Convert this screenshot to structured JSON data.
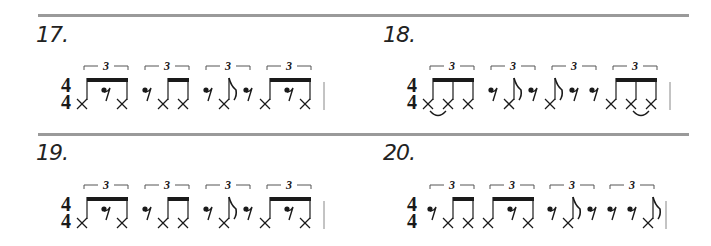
{
  "page": {
    "exercises": [
      {
        "number": "17.",
        "time_signature": {
          "top": "4",
          "bottom": "4"
        },
        "groups": [
          {
            "tuplet": "3",
            "notes": [
              "x-eighth",
              "eighth-rest",
              "x-eighth"
            ]
          },
          {
            "tuplet": "3",
            "notes": [
              "eighth-rest",
              "x-eighth",
              "x-eighth"
            ]
          },
          {
            "tuplet": "3",
            "notes": [
              "eighth-rest",
              "x-eighth-flag",
              "eighth-rest"
            ]
          },
          {
            "tuplet": "3",
            "notes": [
              "x-eighth",
              "eighth-rest",
              "x-eighth"
            ]
          }
        ]
      },
      {
        "number": "18.",
        "time_signature": {
          "top": "4",
          "bottom": "4"
        },
        "groups": [
          {
            "tuplet": "3",
            "notes": [
              "x-eighth",
              "x-eighth",
              "x-eighth"
            ],
            "tie": "1-2"
          },
          {
            "tuplet": "3",
            "notes": [
              "eighth-rest",
              "x-eighth-flag",
              "eighth-rest"
            ]
          },
          {
            "tuplet": "3",
            "notes": [
              "x-eighth-flag",
              "eighth-rest",
              "eighth-rest"
            ]
          },
          {
            "tuplet": "3",
            "notes": [
              "x-eighth",
              "x-eighth",
              "x-eighth"
            ],
            "tie": "2-3"
          }
        ]
      },
      {
        "number": "19.",
        "time_signature": {
          "top": "4",
          "bottom": "4"
        },
        "groups": [
          {
            "tuplet": "3",
            "notes": [
              "x-eighth",
              "eighth-rest",
              "x-eighth"
            ]
          },
          {
            "tuplet": "3",
            "notes": [
              "eighth-rest",
              "x-eighth",
              "x-eighth"
            ]
          },
          {
            "tuplet": "3",
            "notes": [
              "eighth-rest",
              "x-eighth-flag",
              "eighth-rest"
            ]
          },
          {
            "tuplet": "3",
            "notes": [
              "x-eighth",
              "eighth-rest",
              "x-eighth"
            ]
          }
        ]
      },
      {
        "number": "20.",
        "time_signature": {
          "top": "4",
          "bottom": "4"
        },
        "groups": [
          {
            "tuplet": "3",
            "notes": [
              "eighth-rest",
              "x-eighth",
              "x-eighth"
            ]
          },
          {
            "tuplet": "3",
            "notes": [
              "x-eighth",
              "eighth-rest",
              "x-eighth"
            ]
          },
          {
            "tuplet": "3",
            "notes": [
              "eighth-rest",
              "x-eighth-flag",
              "eighth-rest"
            ]
          },
          {
            "tuplet": "3",
            "notes": [
              "eighth-rest",
              "eighth-rest",
              "x-eighth-flag"
            ]
          }
        ]
      }
    ],
    "tuplet_label": "3",
    "colors": {
      "rule": "#9a9a9a",
      "ink": "#1a1a1a",
      "bracket": "#555555"
    }
  }
}
